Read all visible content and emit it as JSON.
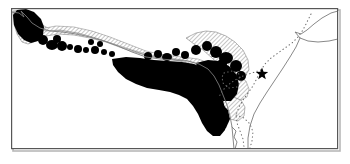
{
  "figure": {
    "name": "species-distribution-map",
    "region": "West and Central Africa",
    "background_color": "#ffffff",
    "frame": {
      "name": "map-frame",
      "color": "#555555",
      "shadow_color": "#aaaaaa",
      "x": 11,
      "y": 8,
      "width": 327,
      "height": 141,
      "stroke_width": 1.2
    }
  },
  "legend_keys": [
    {
      "id": "solid-range",
      "label": "Continuous range",
      "fill": "#000000"
    },
    {
      "id": "hatched-range",
      "label": "Hatched / patchy range",
      "fill": "hatch",
      "hatch_color": "#4a4a4a"
    },
    {
      "id": "locality-dot",
      "label": "Isolated locality record",
      "fill": "#000000"
    },
    {
      "id": "type-locality-star",
      "label": "Type locality",
      "symbol": "star",
      "fill": "#000000"
    },
    {
      "id": "political-border",
      "label": "International boundary",
      "style": "dotted",
      "color": "#777777"
    },
    {
      "id": "coastline",
      "label": "Coastline",
      "style": "solid",
      "color": "#808080"
    }
  ],
  "marker": {
    "name": "type-locality-star",
    "symbol": "★",
    "x": 262,
    "y": 74,
    "size": 13,
    "color": "#000000"
  },
  "geometry": {
    "coastline_main": "M 11,12 L 19,13 L 24,17 L 22,12 L 27,17 L 31,22 L 39,27 L 49,30 L 60,31 L 74,33 L 86,36 L 99,40 L 112,45 L 126,51 L 140,56 L 152,58 L 165,59 L 178,60 L 190,62 L 200,65 L 209,70 L 216,77 L 221,86 L 226,96 L 231,106 L 235,116 L 237,126 L 238,136 L 239,149",
    "coastline_east": "M 338,12 L 330,14 L 320,19 L 312,25 L 306,31 L 300,34 L 294,32 L 299,37 L 306,40 L 316,41 L 327,40 L 336,38 L 338,37 L 338,12",
    "coastline_horn": "M 299,37 L 295,45 L 289,55 L 282,66 L 274,78 L 266,90 L 258,101 L 252,112 L 248,124 L 246,136 L 246,149",
    "border_dotted_north": "M 309,16 L 305,24 L 301,32 L 296,39 L 291,44 L 284,49 L 277,53 L 270,58 L 264,64 L 259,70",
    "border_dotted_south": "M 259,70 L 256,78 L 252,86 L 247,93 L 242,99 L 238,106 L 235,114 L 236,122 L 239,130 L 242,138 L 243,146",
    "border_dotted_west": "M 259,70 L 250,73 L 241,76 L 233,80 L 226,85 L 220,91",
    "solid_range_main": "M 118,58 L 132,57 L 146,59 L 158,61 L 170,62 L 182,63 L 192,65 L 200,69 L 206,75 L 211,82 L 215,90 L 219,99 L 222,108 L 224,117 L 224,125 L 221,131 L 216,134 L 210,132 L 205,127 L 201,120 L 197,112 L 192,105 L 186,99 L 178,95 L 169,92 L 159,90 L 148,88 L 137,84 L 128,79 L 121,73 L 116,66 Z",
    "solid_range_west_lobe": "M 20,12 L 28,11 L 36,14 L 42,20 L 45,27 L 43,34 L 38,39 L 31,41 L 24,38 L 19,33 L 16,26 L 16,18 Z",
    "hatched_band": "M 36,34 L 50,31 L 66,32 L 82,35 L 98,39 L 114,44 L 130,50 L 146,55 L 162,57 L 178,58 L 192,59 L 204,62 L 212,67 L 218,74 L 214,74 L 206,69 L 196,65 L 184,62 L 170,60 L 155,58 L 140,55 L 124,50 L 108,44 L 92,40 L 76,37 L 60,35 L 46,36 L 38,39 Z",
    "hatched_interior": "M 46,30 L 64,28 L 84,30 L 104,35 L 124,42 L 144,50 L 164,54 L 184,56 L 200,58 L 210,62 L 216,68 L 214,72 L 204,66 L 190,62 L 174,59 L 156,56 L 138,52 L 120,46 L 102,40 L 84,35 L 66,32 L 50,33 Z",
    "hatched_east_block": "M 196,36 L 208,33 L 220,34 L 232,38 L 242,45 L 248,54 L 250,64 L 246,71 L 238,72 L 230,68 L 222,62 L 214,55 L 206,48 L 199,42 Z",
    "hatched_south_patch": "M 224,104 L 234,101 L 242,104 L 246,111 L 244,119 L 237,123 L 229,120 L 224,113 Z"
  },
  "locality_dots": [
    {
      "cx": 29,
      "cy": 24,
      "rx": 9,
      "ry": 8
    },
    {
      "cx": 22,
      "cy": 17,
      "rx": 5,
      "ry": 5
    },
    {
      "cx": 35,
      "cy": 32,
      "rx": 4,
      "ry": 4
    },
    {
      "cx": 43,
      "cy": 40,
      "rx": 5,
      "ry": 5
    },
    {
      "cx": 52,
      "cy": 45,
      "rx": 6,
      "ry": 5
    },
    {
      "cx": 62,
      "cy": 46,
      "rx": 5,
      "ry": 5
    },
    {
      "cx": 57,
      "cy": 39,
      "rx": 4,
      "ry": 4
    },
    {
      "cx": 70,
      "cy": 47,
      "rx": 3,
      "ry": 3
    },
    {
      "cx": 78,
      "cy": 49,
      "rx": 4,
      "ry": 4
    },
    {
      "cx": 86,
      "cy": 50,
      "rx": 3,
      "ry": 3
    },
    {
      "cx": 95,
      "cy": 50,
      "rx": 4,
      "ry": 4
    },
    {
      "cx": 104,
      "cy": 52,
      "rx": 3,
      "ry": 3
    },
    {
      "cx": 112,
      "cy": 54,
      "rx": 3,
      "ry": 3
    },
    {
      "cx": 100,
      "cy": 44,
      "rx": 3,
      "ry": 3
    },
    {
      "cx": 91,
      "cy": 42,
      "rx": 3,
      "ry": 3
    },
    {
      "cx": 148,
      "cy": 56,
      "rx": 4,
      "ry": 4
    },
    {
      "cx": 158,
      "cy": 54,
      "rx": 4,
      "ry": 4
    },
    {
      "cx": 167,
      "cy": 57,
      "rx": 5,
      "ry": 4
    },
    {
      "cx": 176,
      "cy": 52,
      "rx": 4,
      "ry": 4
    },
    {
      "cx": 185,
      "cy": 55,
      "rx": 4,
      "ry": 4
    },
    {
      "cx": 196,
      "cy": 50,
      "rx": 5,
      "ry": 5
    },
    {
      "cx": 207,
      "cy": 46,
      "rx": 5,
      "ry": 5
    },
    {
      "cx": 216,
      "cy": 52,
      "rx": 6,
      "ry": 6
    },
    {
      "cx": 226,
      "cy": 58,
      "rx": 7,
      "ry": 6
    },
    {
      "cx": 236,
      "cy": 66,
      "rx": 6,
      "ry": 6
    },
    {
      "cx": 241,
      "cy": 76,
      "rx": 5,
      "ry": 5
    },
    {
      "cx": 232,
      "cy": 88,
      "rx": 5,
      "ry": 5
    },
    {
      "cx": 227,
      "cy": 97,
      "rx": 4,
      "ry": 4
    },
    {
      "cx": 222,
      "cy": 64,
      "rx": 5,
      "ry": 5
    }
  ],
  "border_dots": {
    "name": "political-border-dots",
    "color": "#6b6b6b",
    "radius": 0.9,
    "spacing": 4
  }
}
